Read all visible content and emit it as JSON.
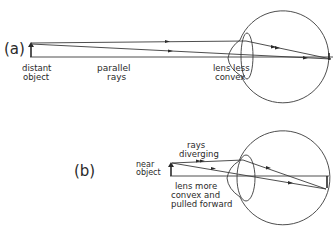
{
  "panel_a": {
    "tag": "(a)",
    "object_label": [
      "distant",
      "object"
    ],
    "rays_label": [
      "parallel",
      "rays"
    ],
    "lens_label": [
      "lens less",
      "convex"
    ]
  },
  "panel_b": {
    "tag": "(b)",
    "object_label": [
      "near",
      "object"
    ],
    "rays_label": [
      "rays",
      "diverging"
    ],
    "lens_label": [
      "lens more",
      "convex and",
      "pulled forward"
    ]
  },
  "colors": {
    "line": "#3a3a3a",
    "text": "#2a2a2a",
    "background": "#ffffff"
  }
}
